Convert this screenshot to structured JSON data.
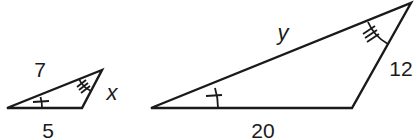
{
  "diagram": {
    "small_triangle": {
      "sides": {
        "top": "7",
        "right": "x",
        "bottom": "5"
      },
      "angle_marks": {
        "left": "single",
        "top": "double"
      }
    },
    "large_triangle": {
      "sides": {
        "top": "y",
        "right": "12",
        "bottom": "20"
      },
      "angle_marks": {
        "left": "single",
        "top": "double"
      }
    },
    "colors": {
      "stroke": "#1a1a1a",
      "background": "#ffffff"
    }
  }
}
